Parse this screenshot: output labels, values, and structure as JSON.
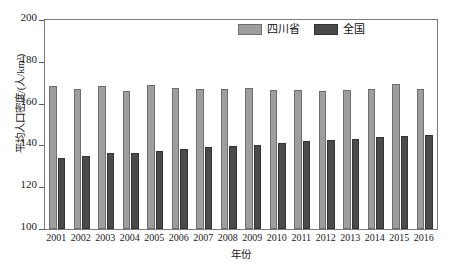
{
  "chart_data": {
    "type": "bar",
    "title": "",
    "xlabel": "年份",
    "ylabel": "平均人口密度/(人/km²)",
    "ylim": [
      100,
      200
    ],
    "yticks": [
      100,
      120,
      140,
      160,
      180,
      200
    ],
    "ytick_labels": [
      "100",
      "120",
      "140",
      "160",
      "180",
      "200"
    ],
    "grid": false,
    "legend_position": "top-right-inside",
    "categories": [
      "2001",
      "2002",
      "2003",
      "2004",
      "2005",
      "2006",
      "2007",
      "2008",
      "2009",
      "2010",
      "2011",
      "2012",
      "2013",
      "2014",
      "2015",
      "2016"
    ],
    "series": [
      {
        "name": "四川省",
        "color": "#9e9e9e",
        "values": [
          168.3,
          167.0,
          168.3,
          166.2,
          169.1,
          167.7,
          167.1,
          166.8,
          167.6,
          166.7,
          166.6,
          166.2,
          166.6,
          167.2,
          169.2,
          167.1
        ]
      },
      {
        "name": "全国",
        "color": "#4a4a4a",
        "values": [
          134.0,
          135.1,
          136.3,
          136.3,
          137.3,
          138.4,
          139.1,
          139.8,
          140.4,
          141.2,
          141.9,
          142.4,
          143.1,
          144.0,
          144.4,
          145.2
        ]
      }
    ]
  },
  "legend": {
    "entries": [
      {
        "label": "四川省",
        "swatch": "sichuan-swatch"
      },
      {
        "label": "全国",
        "swatch": "national-swatch"
      }
    ]
  }
}
